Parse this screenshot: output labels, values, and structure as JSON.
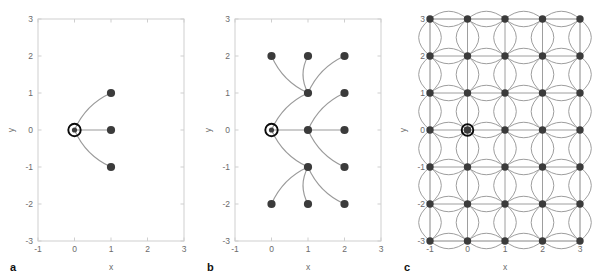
{
  "figure": {
    "background": "#ffffff",
    "node_color": "#3b3b3b",
    "edge_color": "#9a9a9a",
    "axis_color": "#cfcfcf",
    "label_color": "#6b6b6b",
    "origin_ring_color": "#0a0a0a"
  },
  "panels": [
    {
      "id": "a",
      "label": "a",
      "xlabel": "x",
      "ylabel": "y",
      "xlim": [
        -1,
        3
      ],
      "ylim": [
        -3,
        3
      ],
      "xticks": [
        -1,
        0,
        1,
        2,
        3
      ],
      "xticklabels": [
        "-1",
        "0",
        "1",
        "2",
        "3"
      ],
      "yticks": [
        -3,
        -2,
        -1,
        0,
        1,
        2,
        3
      ],
      "yticklabels": [
        "-3",
        "-2",
        "-1",
        "0",
        "1",
        "2",
        "3"
      ],
      "origin": [
        0,
        0
      ],
      "nodes": [
        [
          1,
          1
        ],
        [
          1,
          0
        ],
        [
          1,
          -1
        ]
      ],
      "edges": [
        {
          "from": [
            0,
            0
          ],
          "to": [
            1,
            1
          ]
        },
        {
          "from": [
            0,
            0
          ],
          "to": [
            1,
            0
          ]
        },
        {
          "from": [
            0,
            0
          ],
          "to": [
            1,
            -1
          ]
        }
      ]
    },
    {
      "id": "b",
      "label": "b",
      "xlabel": "x",
      "ylabel": "y",
      "xlim": [
        -1,
        3
      ],
      "ylim": [
        -3,
        3
      ],
      "xticks": [
        -1,
        0,
        1,
        2,
        3
      ],
      "xticklabels": [
        "-1",
        "0",
        "1",
        "2",
        "3"
      ],
      "yticks": [
        -3,
        -2,
        -1,
        0,
        1,
        2,
        3
      ],
      "yticklabels": [
        "-3",
        "-2",
        "-1",
        "0",
        "1",
        "2",
        "3"
      ],
      "origin": [
        0,
        0
      ],
      "nodes": [
        [
          1,
          1
        ],
        [
          1,
          0
        ],
        [
          1,
          -1
        ],
        [
          0,
          2
        ],
        [
          1,
          2
        ],
        [
          2,
          2
        ],
        [
          2,
          1
        ],
        [
          2,
          0
        ],
        [
          2,
          -1
        ],
        [
          0,
          -2
        ],
        [
          1,
          -2
        ],
        [
          2,
          -2
        ]
      ],
      "edges": [
        {
          "from": [
            0,
            0
          ],
          "to": [
            1,
            1
          ]
        },
        {
          "from": [
            0,
            0
          ],
          "to": [
            1,
            0
          ]
        },
        {
          "from": [
            0,
            0
          ],
          "to": [
            1,
            -1
          ]
        },
        {
          "from": [
            1,
            1
          ],
          "to": [
            0,
            2
          ]
        },
        {
          "from": [
            1,
            1
          ],
          "to": [
            1,
            2
          ]
        },
        {
          "from": [
            1,
            1
          ],
          "to": [
            2,
            2
          ]
        },
        {
          "from": [
            1,
            0
          ],
          "to": [
            2,
            1
          ]
        },
        {
          "from": [
            1,
            0
          ],
          "to": [
            2,
            0
          ]
        },
        {
          "from": [
            1,
            0
          ],
          "to": [
            2,
            -1
          ]
        },
        {
          "from": [
            1,
            -1
          ],
          "to": [
            0,
            -2
          ]
        },
        {
          "from": [
            1,
            -1
          ],
          "to": [
            1,
            -2
          ]
        },
        {
          "from": [
            1,
            -1
          ],
          "to": [
            2,
            -2
          ]
        }
      ]
    },
    {
      "id": "c",
      "label": "c",
      "xlabel": "x",
      "ylabel": "y",
      "xlim": [
        -1,
        3
      ],
      "ylim": [
        -3,
        3
      ],
      "xticks": [
        -1,
        0,
        1,
        2,
        3
      ],
      "xticklabels": [
        "-1",
        "0",
        "1",
        "2",
        "3"
      ],
      "yticks": [
        -3,
        -2,
        -1,
        0,
        1,
        2,
        3
      ],
      "yticklabels": [
        "-3",
        "-2",
        "-1",
        "0",
        "1",
        "2",
        "3"
      ],
      "origin": [
        0,
        0
      ],
      "lattice": {
        "x_values": [
          -1,
          0,
          1,
          2,
          3
        ],
        "y_values": [
          -3,
          -2,
          -1,
          0,
          1,
          2,
          3
        ],
        "edges": "all-orthogonal-neighbors",
        "edge_style": "straight-plus-symmetric-arc-pair"
      }
    }
  ],
  "chart_data": {
    "type": "scatter",
    "title": "",
    "xlabel": "x",
    "ylabel": "y",
    "xlim": [
      -1,
      3
    ],
    "ylim": [
      -3,
      3
    ],
    "grid": false,
    "legend": null,
    "panels": [
      {
        "label": "a",
        "description": "Single-step expansion from origin",
        "x": [
          0,
          1,
          1,
          1
        ],
        "y": [
          0,
          1,
          0,
          -1
        ],
        "origin_index": 0,
        "edge_count": 3
      },
      {
        "label": "b",
        "description": "Two-step expansion from origin",
        "x": [
          0,
          1,
          1,
          1,
          0,
          1,
          2,
          2,
          2,
          2,
          0,
          1,
          2
        ],
        "y": [
          0,
          1,
          0,
          -1,
          2,
          2,
          2,
          1,
          0,
          -1,
          -2,
          -2,
          -2
        ],
        "origin_index": 0,
        "edge_count": 12
      },
      {
        "label": "c",
        "description": "Full lattice over x in [-1,3], y in [-3,3]",
        "x": [
          -1,
          0,
          1,
          2,
          3
        ],
        "y": [
          -3,
          -2,
          -1,
          0,
          1,
          2,
          3
        ],
        "origin": [
          0,
          0
        ],
        "node_count": 35
      }
    ]
  }
}
